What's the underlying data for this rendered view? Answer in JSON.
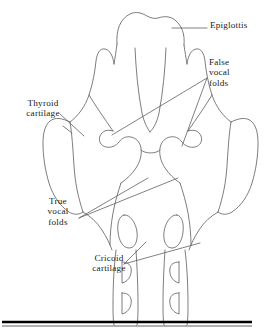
{
  "figure": {
    "labels": [
      {
        "id": "epiglottis",
        "text": "Epiglottis"
      },
      {
        "id": "false-vocal-folds",
        "text": "False\nvocal\nfolds"
      },
      {
        "id": "thyroid-cartilage",
        "text": "Thyroid\ncartilage"
      },
      {
        "id": "true-vocal-folds",
        "text": "True\nvocal\nfolds"
      },
      {
        "id": "cricoid-cartilage",
        "text": "Cricoid\ncartilage"
      }
    ],
    "colors": {
      "outline": "#6e6e72",
      "leader": "#57575c",
      "text": "#1a1a1a",
      "rule": "#000000",
      "background": "#ffffff"
    }
  }
}
